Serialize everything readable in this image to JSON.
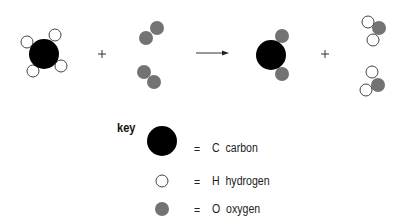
{
  "equation": {
    "reactants": [
      {
        "name": "methane",
        "atoms": [
          "C",
          "H",
          "H",
          "H",
          "H"
        ]
      },
      {
        "name": "oxygen-molecules",
        "count": 2,
        "atoms": [
          "O",
          "O"
        ]
      }
    ],
    "products": [
      {
        "name": "carbon-dioxide",
        "atoms": [
          "C",
          "O",
          "O"
        ]
      },
      {
        "name": "water-molecules",
        "count": 2,
        "atoms": [
          "O",
          "H",
          "H"
        ]
      }
    ],
    "plus_sign": "+",
    "arrow": "→"
  },
  "key": {
    "title": "key",
    "items": [
      {
        "equals": "=",
        "symbol": "C",
        "name": "carbon",
        "label": "C  carbon",
        "color": "#000000"
      },
      {
        "equals": "=",
        "symbol": "H",
        "name": "hydrogen",
        "label": "H  hydrogen",
        "color": "#ffffff"
      },
      {
        "equals": "=",
        "symbol": "O",
        "name": "oxygen",
        "label": "O  oxygen",
        "color": "#777777"
      }
    ]
  },
  "colors": {
    "carbon": "#000000",
    "hydrogen_fill": "#ffffff",
    "hydrogen_stroke": "#444444",
    "oxygen": "#737373"
  }
}
